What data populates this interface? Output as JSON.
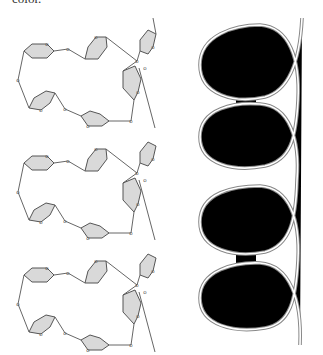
{
  "caption_fragment": "color.",
  "figure": {
    "left_panel": {
      "description": "Repeating macrocyclic sugar-ring chain (three stacked units)",
      "unit_count": 3,
      "rings_per_unit": 6,
      "linker_atom_label": "O",
      "ring_fill": "#d9d9d9",
      "line_color": "#555555"
    },
    "right_panel": {
      "description": "Helix wrapped around two dumbbell-shaped guest molecules",
      "helix_turns": 4,
      "dumbbell_count": 2,
      "helix_color": "#888888",
      "dumbbell_color": "#000000"
    }
  }
}
